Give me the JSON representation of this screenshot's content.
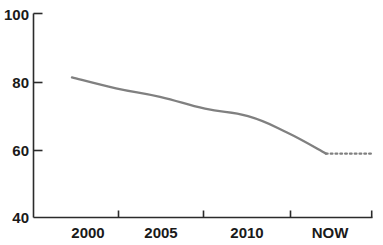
{
  "chart_data": {
    "type": "line",
    "title": "",
    "subtitle": "",
    "xlabel": "",
    "ylabel": "",
    "x_tick_labels": [
      "2000",
      "2005",
      "2010",
      "NOW"
    ],
    "y_tick_labels": [
      "100",
      "80",
      "60",
      "40"
    ],
    "y_tick_values": [
      100,
      80,
      60,
      40
    ],
    "ylim": [
      40,
      100
    ],
    "grid": false,
    "legend": null,
    "legend_position": "none",
    "axis_color": "#2b2b2b",
    "line_color": "#808080",
    "series": [
      {
        "name": "trend",
        "style": "solid",
        "x": [
          "2000",
          "2003",
          "2005",
          "2008",
          "2010",
          "2012",
          "NOW"
        ],
        "points": [
          {
            "x_label": "2000",
            "value": 81.2
          },
          {
            "x_label": "2003",
            "value": 78.0
          },
          {
            "x_label": "2005",
            "value": 75.5
          },
          {
            "x_label": "2008",
            "value": 72.0
          },
          {
            "x_label": "2010",
            "value": 69.8
          },
          {
            "x_label": "2012",
            "value": 65.0
          },
          {
            "x_label": "NOW",
            "value": 58.8
          }
        ]
      },
      {
        "name": "projection",
        "style": "dotted",
        "x": [
          "NOW",
          "future"
        ],
        "points": [
          {
            "x_label": "NOW",
            "value": 58.8
          },
          {
            "x_label": "future",
            "value": 58.8
          }
        ]
      }
    ]
  },
  "axis": {
    "y_labels": [
      "100",
      "80",
      "60",
      "40"
    ],
    "x_labels": [
      "2000",
      "2005",
      "2010",
      "NOW"
    ]
  }
}
